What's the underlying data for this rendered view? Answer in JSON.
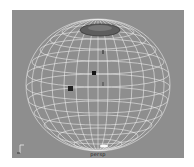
{
  "viewport": {
    "camera_label": "persp",
    "background_color": "#8e8e8e",
    "wireframe_color": "#e8e8e8",
    "object": "sphere-wireframe",
    "selected_face_region": "top-cap",
    "component_markers": 2,
    "icons": {
      "axis": "axis-gizmo-icon"
    }
  }
}
